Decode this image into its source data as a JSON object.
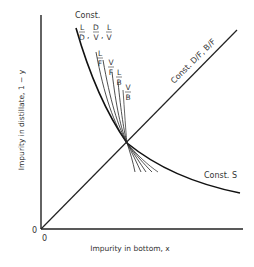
{
  "figure": {
    "x_axis_label": "Impurity in bottom, x",
    "y_axis_label": "Impurity in distillate, 1 − y",
    "x_origin_label": "0",
    "y_origin_label": "0",
    "curve_labels": {
      "const_header": "Const.",
      "ratio_group": [
        {
          "num": "L",
          "den": "D"
        },
        {
          "num": "D",
          "den": "V"
        },
        {
          "num": "L",
          "den": "V"
        }
      ],
      "thin_curves": [
        {
          "num": "L",
          "den": "F"
        },
        {
          "num": "V",
          "den": "F"
        },
        {
          "num": "L",
          "den": "B"
        },
        {
          "num": "V",
          "den": "B"
        }
      ],
      "diagonal": "Const. D/F, B/F",
      "const_s": "Const. S"
    }
  }
}
